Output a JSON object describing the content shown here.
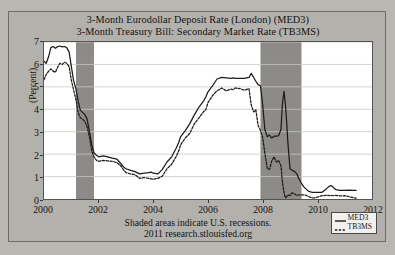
{
  "chart_data": {
    "type": "line",
    "title": "3-Month Eurodollar Deposit Rate (London) (MED3)\n3-Month Treasury Bill: Secondary Market Rate (TB3MS)",
    "title_line1": "3-Month Eurodollar Deposit Rate (London) (MED3)",
    "title_line2": "3-Month Treasury Bill: Secondary Market Rate (TB3MS)",
    "xlabel": "",
    "ylabel": "(Percent)",
    "ylim": [
      0,
      7
    ],
    "xlim": [
      2000,
      2012
    ],
    "grid": true,
    "grid_orientation": "horizontal",
    "legend_position": "bottom-right",
    "source_note": "Shaded areas indicate U.S. recessions.",
    "source_credit": "2011 research.stlouisfed.org",
    "y_ticks": [
      0,
      1,
      2,
      3,
      4,
      5,
      6,
      7
    ],
    "x_ticks": [
      2000,
      2002,
      2004,
      2006,
      2008,
      2010,
      2012
    ],
    "shaded_regions": [
      {
        "label": "2001 recession",
        "start": 2001.17,
        "end": 2001.83
      },
      {
        "label": "2007-2009 recession",
        "start": 2007.92,
        "end": 2009.42
      }
    ],
    "colors": {
      "plot_background": "#ffffff",
      "figure_background": "#b3b1ac",
      "shading": "#8d8b87",
      "med3_line": "#1c1a18",
      "tb3ms_line": "#1c1a18",
      "grid": "#c9c7c4",
      "axis": "#55534f"
    },
    "series": [
      {
        "name": "MED3",
        "style": "solid",
        "x": [
          2000.0,
          2000.08,
          2000.17,
          2000.25,
          2000.33,
          2000.42,
          2000.5,
          2000.58,
          2000.67,
          2000.75,
          2000.83,
          2000.92,
          2001.0,
          2001.08,
          2001.17,
          2001.25,
          2001.33,
          2001.42,
          2001.5,
          2001.58,
          2001.67,
          2001.75,
          2001.83,
          2001.92,
          2002.0,
          2002.17,
          2002.33,
          2002.5,
          2002.67,
          2002.83,
          2002.92,
          2003.0,
          2003.17,
          2003.33,
          2003.5,
          2003.67,
          2003.83,
          2003.92,
          2004.0,
          2004.17,
          2004.33,
          2004.5,
          2004.67,
          2004.83,
          2004.92,
          2005.0,
          2005.17,
          2005.33,
          2005.5,
          2005.67,
          2005.83,
          2005.92,
          2006.0,
          2006.17,
          2006.33,
          2006.5,
          2006.67,
          2006.83,
          2006.92,
          2007.0,
          2007.17,
          2007.33,
          2007.5,
          2007.58,
          2007.67,
          2007.75,
          2007.83,
          2007.92,
          2008.0,
          2008.08,
          2008.17,
          2008.25,
          2008.33,
          2008.42,
          2008.5,
          2008.58,
          2008.67,
          2008.72,
          2008.78,
          2008.83,
          2008.88,
          2008.92,
          2009.0,
          2009.08,
          2009.17,
          2009.25,
          2009.33,
          2009.42,
          2009.5,
          2009.58,
          2009.67,
          2009.75,
          2009.83,
          2009.92,
          2010.0,
          2010.17,
          2010.33,
          2010.42,
          2010.5,
          2010.58,
          2010.67,
          2010.83,
          2010.92,
          2011.0,
          2011.17,
          2011.33,
          2011.42
        ],
        "y": [
          6.15,
          6.05,
          6.35,
          6.75,
          6.8,
          6.72,
          6.8,
          6.82,
          6.78,
          6.8,
          6.75,
          6.55,
          5.9,
          5.3,
          4.9,
          4.35,
          3.95,
          3.85,
          3.75,
          3.55,
          2.95,
          2.4,
          2.05,
          1.95,
          1.88,
          1.92,
          1.88,
          1.82,
          1.78,
          1.55,
          1.42,
          1.35,
          1.28,
          1.22,
          1.12,
          1.15,
          1.18,
          1.2,
          1.15,
          1.12,
          1.32,
          1.65,
          1.88,
          2.25,
          2.5,
          2.78,
          3.05,
          3.35,
          3.75,
          4.1,
          4.35,
          4.55,
          4.78,
          5.05,
          5.35,
          5.42,
          5.4,
          5.38,
          5.4,
          5.38,
          5.38,
          5.38,
          5.42,
          5.6,
          5.42,
          5.25,
          5.1,
          5.05,
          4.2,
          3.1,
          2.78,
          2.85,
          2.72,
          2.8,
          2.8,
          2.82,
          3.1,
          4.2,
          4.8,
          4.25,
          3.4,
          2.55,
          1.35,
          1.28,
          1.22,
          1.12,
          0.9,
          0.7,
          0.55,
          0.45,
          0.35,
          0.32,
          0.3,
          0.3,
          0.3,
          0.3,
          0.45,
          0.55,
          0.6,
          0.52,
          0.42,
          0.38,
          0.38,
          0.38,
          0.4,
          0.38,
          0.38
        ]
      },
      {
        "name": "TB3MS",
        "style": "dashed",
        "x": [
          2000.0,
          2000.08,
          2000.17,
          2000.25,
          2000.33,
          2000.42,
          2000.5,
          2000.58,
          2000.67,
          2000.75,
          2000.83,
          2000.92,
          2001.0,
          2001.08,
          2001.17,
          2001.25,
          2001.33,
          2001.42,
          2001.5,
          2001.58,
          2001.67,
          2001.75,
          2001.83,
          2001.92,
          2002.0,
          2002.17,
          2002.33,
          2002.5,
          2002.67,
          2002.83,
          2002.92,
          2003.0,
          2003.17,
          2003.33,
          2003.5,
          2003.67,
          2003.83,
          2003.92,
          2004.0,
          2004.17,
          2004.33,
          2004.5,
          2004.67,
          2004.83,
          2004.92,
          2005.0,
          2005.17,
          2005.33,
          2005.5,
          2005.67,
          2005.83,
          2005.92,
          2006.0,
          2006.17,
          2006.33,
          2006.5,
          2006.67,
          2006.83,
          2006.92,
          2007.0,
          2007.17,
          2007.33,
          2007.5,
          2007.58,
          2007.67,
          2007.75,
          2007.83,
          2007.92,
          2008.0,
          2008.08,
          2008.17,
          2008.25,
          2008.33,
          2008.42,
          2008.5,
          2008.58,
          2008.67,
          2008.72,
          2008.78,
          2008.83,
          2008.88,
          2008.92,
          2009.0,
          2009.08,
          2009.17,
          2009.25,
          2009.33,
          2009.42,
          2009.5,
          2009.58,
          2009.67,
          2009.75,
          2009.83,
          2009.92,
          2010.0,
          2010.17,
          2010.33,
          2010.5,
          2010.67,
          2010.83,
          2010.92,
          2011.0,
          2011.17,
          2011.33,
          2011.42
        ],
        "y": [
          5.32,
          5.55,
          5.7,
          5.8,
          5.7,
          5.65,
          5.88,
          6.05,
          6.0,
          6.1,
          6.05,
          5.9,
          5.3,
          4.88,
          4.42,
          3.85,
          3.62,
          3.55,
          3.45,
          3.2,
          2.72,
          2.12,
          1.88,
          1.72,
          1.68,
          1.72,
          1.7,
          1.68,
          1.62,
          1.45,
          1.28,
          1.18,
          1.12,
          1.08,
          0.92,
          0.95,
          0.92,
          0.9,
          0.88,
          0.92,
          1.02,
          1.35,
          1.55,
          1.88,
          2.12,
          2.42,
          2.72,
          2.92,
          3.35,
          3.62,
          3.88,
          3.98,
          4.3,
          4.62,
          4.82,
          4.95,
          4.82,
          4.9,
          4.88,
          4.95,
          4.92,
          4.85,
          4.92,
          4.2,
          3.88,
          3.98,
          3.3,
          3.05,
          2.75,
          2.05,
          1.35,
          1.32,
          1.68,
          1.88,
          1.65,
          1.72,
          1.48,
          0.8,
          0.3,
          0.05,
          0.1,
          0.18,
          0.15,
          0.28,
          0.22,
          0.16,
          0.18,
          0.18,
          0.18,
          0.17,
          0.12,
          0.07,
          0.05,
          0.05,
          0.08,
          0.15,
          0.16,
          0.15,
          0.16,
          0.14,
          0.14,
          0.15,
          0.1,
          0.05,
          0.04
        ]
      }
    ]
  },
  "legend": {
    "items": [
      {
        "label": "MED3",
        "style": "solid"
      },
      {
        "label": "TB3MS",
        "style": "dashed"
      }
    ]
  }
}
